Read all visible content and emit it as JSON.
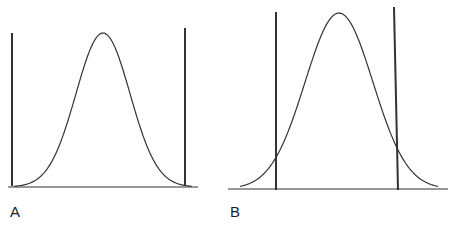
{
  "figure": {
    "panels": [
      {
        "label": "A",
        "description": "Bell curve with vertical boundary lines positioned at the tails (outside the curve)",
        "baseline": {
          "x1": 8,
          "x2": 198,
          "y": 187
        },
        "curve": {
          "center_x": 103,
          "peak_y": 33,
          "sigma_px": 27,
          "base_y": 187,
          "x_start": 14,
          "x_end": 192
        },
        "lines": [
          {
            "x1": 12,
            "y1": 33,
            "x2": 12,
            "y2": 186
          },
          {
            "x1": 185,
            "y1": 28,
            "x2": 185,
            "y2": 186
          }
        ]
      },
      {
        "label": "B",
        "description": "Bell curve with vertical boundary lines crossing the curve near its tails",
        "baseline": {
          "x1": 228,
          "x2": 448,
          "y": 189
        },
        "curve": {
          "center_x": 339,
          "peak_y": 13,
          "sigma_px": 34,
          "base_y": 189,
          "x_start": 240,
          "x_end": 438
        },
        "lines": [
          {
            "x1": 276,
            "y1": 12,
            "x2": 276,
            "y2": 190
          },
          {
            "x1": 394,
            "y1": 7,
            "x2": 398,
            "y2": 190
          }
        ]
      }
    ],
    "stroke_color": "#333333",
    "label_color": "#222222"
  }
}
